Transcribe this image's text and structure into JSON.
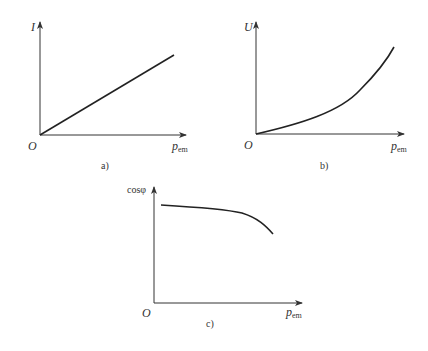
{
  "figure": {
    "panels": [
      {
        "id": "a",
        "caption": "a)",
        "y_label": "I",
        "x_label_main": "p",
        "x_label_sub": "em",
        "origin_label": "O",
        "curve_shape": "linear increasing"
      },
      {
        "id": "b",
        "caption": "b)",
        "y_label": "U",
        "x_label_main": "p",
        "x_label_sub": "em",
        "origin_label": "O",
        "curve_shape": "convex increasing"
      },
      {
        "id": "c",
        "caption": "c)",
        "y_label": "cosφ",
        "x_label_main": "p",
        "x_label_sub": "em",
        "origin_label": "O",
        "curve_shape": "slowly decreasing then dropping"
      }
    ]
  },
  "colors": {
    "axis": "#333333",
    "curve": "#222222",
    "background": "#ffffff"
  }
}
